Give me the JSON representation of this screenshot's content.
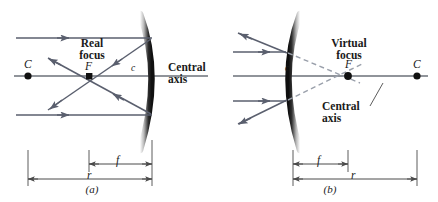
{
  "figure": {
    "colors": {
      "ray": "#5a5f6e",
      "mirror_dark": "#1c1c1c",
      "mirror_light": "#cfcfcf",
      "axis": "#6b7079",
      "dashed": "#9aa0ab",
      "dimension": "#4a4a4a",
      "text": "#1a1a1a"
    }
  },
  "panel_a": {
    "caption": "(a)",
    "labels": {
      "center_of_curvature": "C",
      "focus_point": "F",
      "focus_title_line1": "Real",
      "focus_title_line2": "focus",
      "vertex": "c",
      "central_axis_line1": "Central",
      "central_axis_line2": "axis",
      "focal_length": "f",
      "radius": "r"
    },
    "mirror_type": "concave",
    "ray_count": 2
  },
  "panel_b": {
    "caption": "(b)",
    "labels": {
      "center_of_curvature": "C",
      "focus_point": "F",
      "focus_title_line1": "Virtual",
      "focus_title_line2": "focus",
      "vertex": "c",
      "central_axis_line1": "Central",
      "central_axis_line2": "axis",
      "focal_length": "f",
      "radius": "r"
    },
    "mirror_type": "convex",
    "ray_count": 2
  }
}
